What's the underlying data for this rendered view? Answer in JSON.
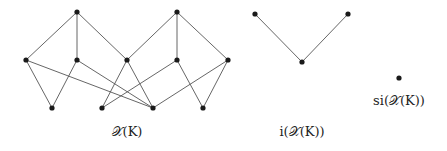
{
  "diagrams": [
    {
      "id": "XK",
      "label": "𝒳(K)",
      "label_pos": [
        127,
        124
      ],
      "nodes": [
        {
          "id": "t1",
          "x": 77,
          "y": 12
        },
        {
          "id": "t2",
          "x": 177,
          "y": 12
        },
        {
          "id": "m1",
          "x": 26,
          "y": 60
        },
        {
          "id": "m2",
          "x": 77,
          "y": 60
        },
        {
          "id": "m3",
          "x": 127,
          "y": 60
        },
        {
          "id": "m4",
          "x": 177,
          "y": 60
        },
        {
          "id": "m5",
          "x": 228,
          "y": 60
        },
        {
          "id": "b1",
          "x": 52,
          "y": 108
        },
        {
          "id": "b2",
          "x": 102,
          "y": 108
        },
        {
          "id": "b3",
          "x": 153,
          "y": 108
        },
        {
          "id": "b4",
          "x": 203,
          "y": 108
        }
      ],
      "edges": [
        [
          "t1",
          "m1"
        ],
        [
          "t1",
          "m2"
        ],
        [
          "t1",
          "m3"
        ],
        [
          "t2",
          "m3"
        ],
        [
          "t2",
          "m4"
        ],
        [
          "t2",
          "m5"
        ],
        [
          "m1",
          "b1"
        ],
        [
          "m1",
          "b3"
        ],
        [
          "m2",
          "b1"
        ],
        [
          "m2",
          "b3"
        ],
        [
          "m3",
          "b2"
        ],
        [
          "m3",
          "b3"
        ],
        [
          "m4",
          "b2"
        ],
        [
          "m4",
          "b4"
        ],
        [
          "m5",
          "b3"
        ],
        [
          "m5",
          "b4"
        ]
      ]
    },
    {
      "id": "iXK",
      "label": "i(𝒳(K))",
      "label_pos": [
        302,
        124
      ],
      "nodes": [
        {
          "id": "a",
          "x": 255,
          "y": 14
        },
        {
          "id": "b",
          "x": 348,
          "y": 14
        },
        {
          "id": "c",
          "x": 302,
          "y": 62
        }
      ],
      "edges": [
        [
          "a",
          "c"
        ],
        [
          "b",
          "c"
        ]
      ]
    },
    {
      "id": "siXK",
      "label": "si(𝒳(K))",
      "label_pos": [
        399,
        93
      ],
      "nodes": [
        {
          "id": "s",
          "x": 399,
          "y": 78
        }
      ],
      "edges": []
    }
  ],
  "labels": {
    "XK": "𝒳(K)",
    "iXK": "i(𝒳(K))",
    "siXK": "si(𝒳(K))"
  },
  "colors": {
    "edge": "#555555",
    "node": "#1a1a1a",
    "background": "#ffffff"
  }
}
